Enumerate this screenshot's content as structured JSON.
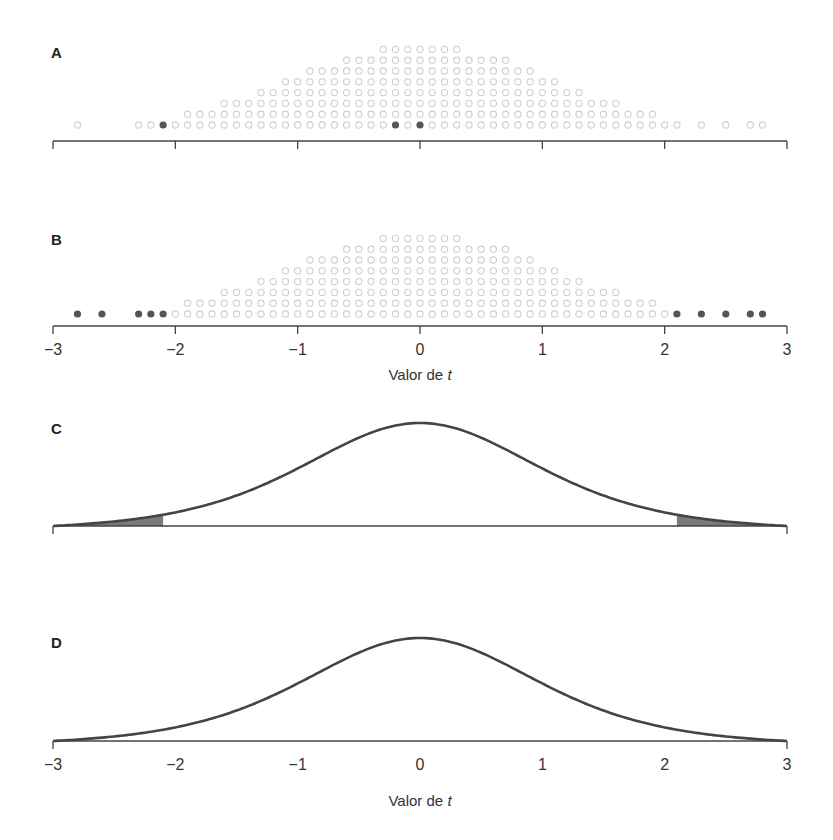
{
  "figure": {
    "panels": [
      {
        "id": "A",
        "label": "A",
        "type": "dotplot"
      },
      {
        "id": "B",
        "label": "B",
        "type": "dotplot"
      },
      {
        "id": "C",
        "label": "C",
        "type": "density"
      },
      {
        "id": "D",
        "label": "D",
        "type": "density"
      }
    ],
    "xlabel_prefix": "Valor de ",
    "xlabel_var": "t",
    "ticks": [
      "−3",
      "−2",
      "−1",
      "0",
      "1",
      "2",
      "3"
    ],
    "colors": {
      "hollow_dot": "#cfcfcf",
      "filled_dot": "#555555",
      "curve": "#444444",
      "shade": "#7a7a7a",
      "axis": "#444444"
    }
  },
  "chart_data": [
    {
      "panel": "A",
      "type": "scatter",
      "title": "",
      "description": "Dot plot (stacked) of simulated t values; highlighted observations shown as filled dots",
      "xlim": [
        -3,
        3
      ],
      "grid": false,
      "hollow_dot_rows": [
        {
          "row": 0,
          "x_from": -2.8,
          "x_to": 2.8,
          "gaps": [
            [
              -2.75,
              -2.45
            ],
            [
              -2.45,
              -2.35
            ],
            [
              2.15,
              2.25
            ],
            [
              2.35,
              2.45
            ],
            [
              2.55,
              2.65
            ]
          ]
        },
        {
          "row": 1,
          "x_from": -1.9,
          "x_to": 1.9
        },
        {
          "row": 2,
          "x_from": -1.6,
          "x_to": 1.6
        },
        {
          "row": 3,
          "x_from": -1.3,
          "x_to": 1.3
        },
        {
          "row": 4,
          "x_from": -1.1,
          "x_to": 1.1
        },
        {
          "row": 5,
          "x_from": -0.9,
          "x_to": 0.9
        },
        {
          "row": 6,
          "x_from": -0.6,
          "x_to": 0.7
        },
        {
          "row": 7,
          "x_from": -0.3,
          "x_to": 0.3
        }
      ],
      "highlighted_points": [
        -2.1,
        -0.2,
        0.0
      ]
    },
    {
      "panel": "B",
      "type": "scatter",
      "title": "",
      "description": "Same dot plot; filled dots mark values in the tails (|t| > 2.1)",
      "xlim": [
        -3,
        3
      ],
      "grid": false,
      "highlighted_points": [
        -2.8,
        -2.6,
        -2.3,
        -2.2,
        -2.1,
        2.1,
        2.3,
        2.5,
        2.7,
        2.8
      ],
      "xlabel": "Valor de t",
      "xticks": [
        -3,
        -2,
        -1,
        0,
        1,
        2,
        3
      ]
    },
    {
      "panel": "C",
      "type": "area",
      "title": "",
      "description": "t-distribution density curve with both tails shaded beyond critical value",
      "xlim": [
        -3,
        3
      ],
      "shaded_regions": [
        [
          -3,
          -2.1
        ],
        [
          2.1,
          3
        ]
      ],
      "grid": false
    },
    {
      "panel": "D",
      "type": "area",
      "title": "",
      "description": "t-distribution density curve with small tails shaded beyond a larger critical value",
      "xlim": [
        -3,
        3
      ],
      "shaded_regions": [
        [
          -3,
          -2.75
        ],
        [
          2.75,
          3
        ]
      ],
      "xlabel": "Valor de t",
      "xticks": [
        -3,
        -2,
        -1,
        0,
        1,
        2,
        3
      ],
      "grid": false
    }
  ]
}
